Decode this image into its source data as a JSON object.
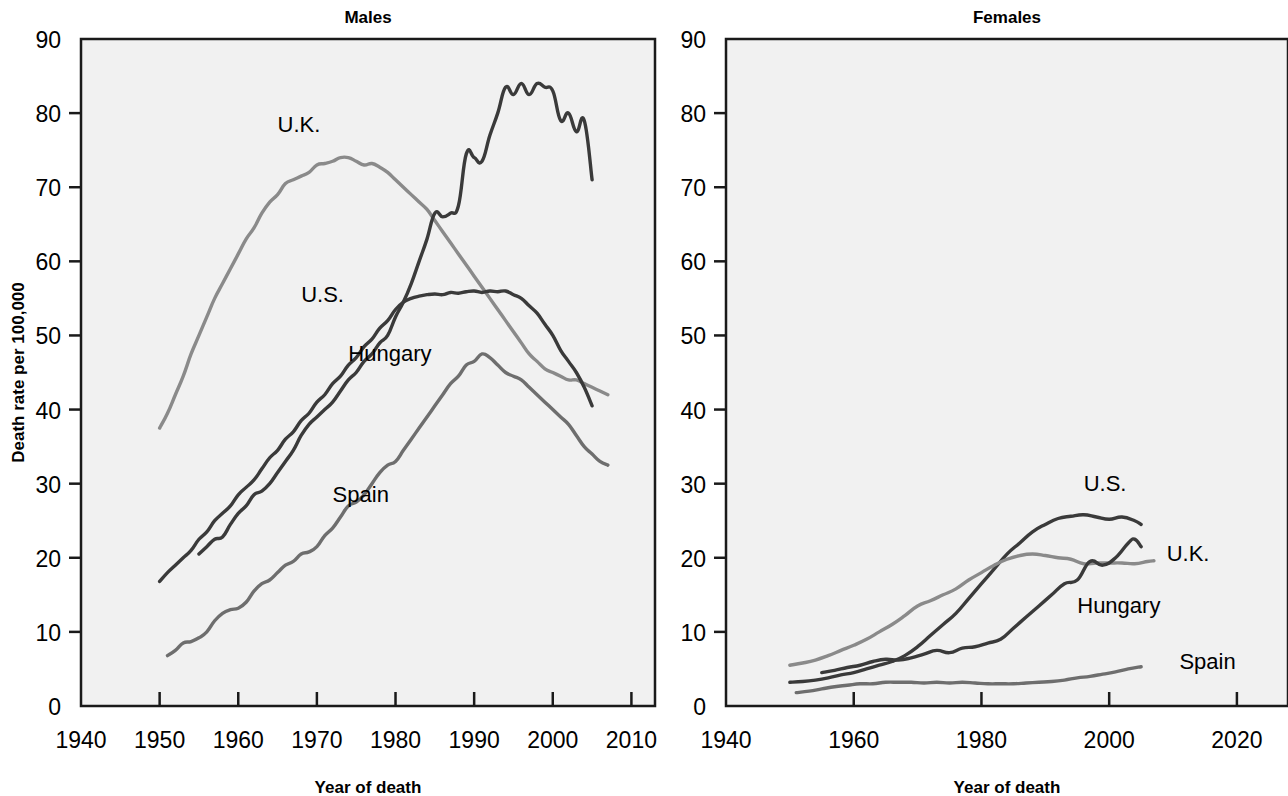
{
  "figure": {
    "background": "#ffffff",
    "plot_background": "#f1f1f1",
    "axis_color": "#1a1a1a"
  },
  "panels": [
    {
      "key": "males",
      "title": "Males",
      "xlabel": "Year of death",
      "ylabel": "Death rate per 100,000"
    },
    {
      "key": "females",
      "title": "Females",
      "xlabel": "Year of death",
      "ylabel": ""
    }
  ],
  "chart_data": [
    {
      "type": "line",
      "title": "Males",
      "xlabel": "Year of death",
      "ylabel": "Death rate per 100,000",
      "xlim": [
        1940,
        2013
      ],
      "ylim": [
        0,
        90
      ],
      "xticks": [
        1940,
        1950,
        1960,
        1970,
        1980,
        1990,
        2000,
        2010
      ],
      "yticks": [
        0,
        10,
        20,
        30,
        40,
        50,
        60,
        70,
        80,
        90
      ],
      "grid": false,
      "legend": "inline-labels",
      "series": [
        {
          "name": "U.K.",
          "color": "#8a8a8a",
          "label_x": 1965,
          "label_y": 77.5,
          "x": [
            1950,
            1951,
            1952,
            1953,
            1954,
            1955,
            1956,
            1957,
            1958,
            1959,
            1960,
            1961,
            1962,
            1963,
            1964,
            1965,
            1966,
            1967,
            1968,
            1969,
            1970,
            1971,
            1972,
            1973,
            1974,
            1975,
            1976,
            1977,
            1978,
            1979,
            1980,
            1981,
            1982,
            1983,
            1984,
            1985,
            1986,
            1987,
            1988,
            1989,
            1990,
            1991,
            1992,
            1993,
            1994,
            1995,
            1996,
            1997,
            1998,
            1999,
            2000,
            2001,
            2002,
            2003,
            2004,
            2005,
            2006,
            2007
          ],
          "y": [
            37.5,
            39.5,
            42.0,
            44.5,
            47.5,
            50.0,
            52.5,
            55.0,
            57.0,
            59.0,
            61.0,
            63.0,
            64.5,
            66.5,
            68.0,
            69.0,
            70.5,
            71.0,
            71.5,
            72.0,
            73.0,
            73.2,
            73.5,
            74.0,
            74.0,
            73.5,
            73.0,
            73.2,
            72.7,
            72.0,
            71.0,
            70.0,
            69.0,
            68.0,
            67.0,
            65.5,
            64.0,
            62.5,
            61.0,
            59.5,
            58.0,
            56.5,
            55.0,
            53.5,
            52.0,
            50.5,
            49.0,
            47.5,
            46.5,
            45.5,
            45.0,
            44.5,
            44.0,
            44.0,
            43.5,
            43.0,
            42.5,
            42.0
          ]
        },
        {
          "name": "U.S.",
          "color": "#3a3a3a",
          "label_x": 1968,
          "label_y": 54.5,
          "x": [
            1950,
            1951,
            1952,
            1953,
            1954,
            1955,
            1956,
            1957,
            1958,
            1959,
            1960,
            1961,
            1962,
            1963,
            1964,
            1965,
            1966,
            1967,
            1968,
            1969,
            1970,
            1971,
            1972,
            1973,
            1974,
            1975,
            1976,
            1977,
            1978,
            1979,
            1980,
            1981,
            1982,
            1983,
            1984,
            1985,
            1986,
            1987,
            1988,
            1989,
            1990,
            1991,
            1992,
            1993,
            1994,
            1995,
            1996,
            1997,
            1998,
            1999,
            2000,
            2001,
            2002,
            2003,
            2004,
            2005
          ],
          "y": [
            16.8,
            18.0,
            19.0,
            20.0,
            21.0,
            22.5,
            23.5,
            25.0,
            26.0,
            27.0,
            28.5,
            29.5,
            30.5,
            32.0,
            33.5,
            34.5,
            36.0,
            37.0,
            38.5,
            39.5,
            41.0,
            42.0,
            43.5,
            44.5,
            46.0,
            47.0,
            48.5,
            49.5,
            51.0,
            52.0,
            53.5,
            54.5,
            55.0,
            55.3,
            55.5,
            55.6,
            55.5,
            55.8,
            55.7,
            55.9,
            56.0,
            55.8,
            56.0,
            55.9,
            56.0,
            55.5,
            55.0,
            54.0,
            53.0,
            51.5,
            50.0,
            48.0,
            46.5,
            45.0,
            43.0,
            40.5
          ]
        },
        {
          "name": "Hungary",
          "color": "#3a3a3a",
          "label_x": 1974,
          "label_y": 46.5,
          "x": [
            1955,
            1956,
            1957,
            1958,
            1959,
            1960,
            1961,
            1962,
            1963,
            1964,
            1965,
            1966,
            1967,
            1968,
            1969,
            1970,
            1971,
            1972,
            1973,
            1974,
            1975,
            1976,
            1977,
            1978,
            1979,
            1980,
            1981,
            1982,
            1983,
            1984,
            1985,
            1986,
            1987,
            1988,
            1989,
            1990,
            1991,
            1992,
            1993,
            1994,
            1995,
            1996,
            1997,
            1998,
            1999,
            2000,
            2001,
            2002,
            2003,
            2004,
            2005
          ],
          "y": [
            20.5,
            21.5,
            22.5,
            22.8,
            24.5,
            26.0,
            27.0,
            28.5,
            29.0,
            30.0,
            31.5,
            33.0,
            34.5,
            36.5,
            38.0,
            39.0,
            40.0,
            41.0,
            42.5,
            44.0,
            45.0,
            46.5,
            47.5,
            49.0,
            50.0,
            52.5,
            54.5,
            57.0,
            60.0,
            63.0,
            66.5,
            66.0,
            66.5,
            67.5,
            74.5,
            74.0,
            73.5,
            77.0,
            80.0,
            83.5,
            82.5,
            84.0,
            82.5,
            84.0,
            83.5,
            83.0,
            79.0,
            80.0,
            77.5,
            79.0,
            71.0
          ]
        },
        {
          "name": "Spain",
          "color": "#6e6e6e",
          "label_x": 1972,
          "label_y": 27.5,
          "x": [
            1951,
            1952,
            1953,
            1954,
            1955,
            1956,
            1957,
            1958,
            1959,
            1960,
            1961,
            1962,
            1963,
            1964,
            1965,
            1966,
            1967,
            1968,
            1969,
            1970,
            1971,
            1972,
            1973,
            1974,
            1975,
            1976,
            1977,
            1978,
            1979,
            1980,
            1981,
            1982,
            1983,
            1984,
            1985,
            1986,
            1987,
            1988,
            1989,
            1990,
            1991,
            1992,
            1993,
            1994,
            1995,
            1996,
            1997,
            1998,
            1999,
            2000,
            2001,
            2002,
            2003,
            2004,
            2005,
            2006,
            2007
          ],
          "y": [
            6.8,
            7.5,
            8.5,
            8.7,
            9.2,
            10.0,
            11.5,
            12.5,
            13.0,
            13.2,
            14.0,
            15.5,
            16.5,
            17.0,
            18.0,
            19.0,
            19.5,
            20.5,
            20.8,
            21.5,
            23.0,
            24.0,
            25.5,
            27.0,
            27.5,
            28.5,
            30.0,
            31.5,
            32.5,
            33.0,
            34.5,
            36.0,
            37.5,
            39.0,
            40.5,
            42.0,
            43.5,
            44.5,
            46.0,
            46.5,
            47.5,
            47.0,
            46.0,
            45.0,
            44.5,
            44.0,
            43.0,
            42.0,
            41.0,
            40.0,
            39.0,
            38.0,
            36.5,
            35.0,
            34.0,
            33.0,
            32.5
          ]
        }
      ]
    },
    {
      "type": "line",
      "title": "Females",
      "xlabel": "Year of death",
      "ylabel": "",
      "xlim": [
        1940,
        2028
      ],
      "ylim": [
        0,
        90
      ],
      "xticks": [
        1940,
        1960,
        1980,
        2000,
        2020
      ],
      "yticks": [
        0,
        10,
        20,
        30,
        40,
        50,
        60,
        70,
        80,
        90
      ],
      "grid": false,
      "legend": "inline-labels",
      "series": [
        {
          "name": "U.S.",
          "color": "#3a3a3a",
          "label_x": 1996,
          "label_y": 29.0,
          "x": [
            1950,
            1952,
            1954,
            1956,
            1958,
            1960,
            1962,
            1964,
            1966,
            1968,
            1970,
            1972,
            1974,
            1976,
            1978,
            1980,
            1982,
            1984,
            1986,
            1988,
            1990,
            1992,
            1994,
            1996,
            1998,
            2000,
            2002,
            2004,
            2005
          ],
          "y": [
            3.2,
            3.3,
            3.5,
            3.8,
            4.2,
            4.5,
            5.0,
            5.5,
            6.0,
            6.8,
            8.0,
            9.5,
            11.0,
            12.5,
            14.5,
            16.5,
            18.5,
            20.5,
            22.0,
            23.5,
            24.5,
            25.3,
            25.6,
            25.8,
            25.5,
            25.2,
            25.5,
            25.0,
            24.5
          ]
        },
        {
          "name": "U.K.",
          "color": "#8a8a8a",
          "label_x": 2009,
          "label_y": 19.5,
          "x": [
            1950,
            1952,
            1954,
            1956,
            1958,
            1960,
            1962,
            1964,
            1966,
            1968,
            1970,
            1972,
            1974,
            1976,
            1978,
            1980,
            1982,
            1984,
            1986,
            1988,
            1990,
            1992,
            1994,
            1996,
            1998,
            2000,
            2002,
            2004,
            2006,
            2007
          ],
          "y": [
            5.5,
            5.8,
            6.2,
            6.8,
            7.5,
            8.2,
            9.0,
            10.0,
            11.0,
            12.2,
            13.5,
            14.2,
            15.0,
            15.8,
            17.0,
            18.0,
            19.0,
            19.8,
            20.3,
            20.5,
            20.3,
            20.0,
            19.8,
            19.2,
            19.3,
            19.3,
            19.3,
            19.2,
            19.5,
            19.6
          ]
        },
        {
          "name": "Hungary",
          "color": "#3a3a3a",
          "label_x": 1995,
          "label_y": 12.5,
          "x": [
            1955,
            1957,
            1959,
            1961,
            1963,
            1965,
            1967,
            1969,
            1971,
            1973,
            1975,
            1977,
            1979,
            1981,
            1983,
            1985,
            1987,
            1989,
            1991,
            1993,
            1995,
            1997,
            1999,
            2001,
            2003,
            2004,
            2005
          ],
          "y": [
            4.5,
            4.8,
            5.2,
            5.5,
            6.0,
            6.3,
            6.2,
            6.5,
            7.0,
            7.5,
            7.2,
            7.8,
            8.0,
            8.5,
            9.0,
            10.5,
            12.0,
            13.5,
            15.0,
            16.5,
            17.0,
            19.5,
            19.0,
            20.0,
            22.0,
            22.5,
            21.5
          ]
        },
        {
          "name": "Spain",
          "color": "#6e6e6e",
          "label_x": 2011,
          "label_y": 5.0,
          "x": [
            1951,
            1953,
            1955,
            1957,
            1959,
            1961,
            1963,
            1965,
            1967,
            1969,
            1971,
            1973,
            1975,
            1977,
            1979,
            1981,
            1983,
            1985,
            1987,
            1989,
            1991,
            1993,
            1995,
            1997,
            1999,
            2001,
            2003,
            2005
          ],
          "y": [
            1.8,
            2.0,
            2.3,
            2.6,
            2.8,
            3.0,
            3.0,
            3.2,
            3.2,
            3.2,
            3.1,
            3.2,
            3.1,
            3.2,
            3.1,
            3.0,
            3.0,
            3.0,
            3.1,
            3.2,
            3.3,
            3.5,
            3.8,
            4.0,
            4.3,
            4.6,
            5.0,
            5.3
          ]
        }
      ]
    }
  ]
}
